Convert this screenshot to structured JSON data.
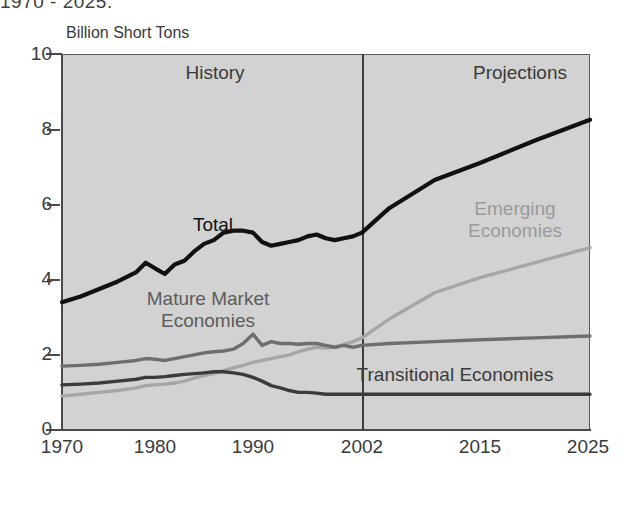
{
  "title_cut": "1970 - 2025.",
  "axis": {
    "y_unit_label": "Billion Short Tons",
    "y_ticks": [
      "0",
      "2",
      "4",
      "6",
      "8",
      "10"
    ],
    "y_tick_values": [
      0,
      2,
      4,
      6,
      8,
      10
    ],
    "x_ticks": [
      "1970",
      "1980",
      "1990",
      "2002",
      "2015",
      "2025"
    ],
    "x_tick_values": [
      1970,
      1980,
      1990,
      2002,
      2015,
      2025
    ],
    "ylim": [
      0,
      10
    ]
  },
  "sections": {
    "history_label": "History",
    "projections_label": "Projections",
    "divider_year": 2002
  },
  "series_labels": {
    "total": "Total",
    "mature": "Mature Market\nEconomies",
    "emerging": "Emerging\nEconomies",
    "transitional": "Transitional Economies"
  },
  "colors": {
    "plot_background": "#d2d2d2",
    "total": "#111111",
    "mature": "#6e6e6e",
    "emerging": "#a6a6a6",
    "transitional": "#3b3b3b",
    "axis": "#4a4a4a",
    "text": "#3a3a3a"
  },
  "chart_data": {
    "type": "line",
    "title": "1970 - 2025.",
    "xlabel": "",
    "ylabel": "Billion Short Tons",
    "ylim": [
      0,
      10
    ],
    "xlim": [
      1970,
      2025
    ],
    "grid": false,
    "legend": "inline-annotations",
    "annotations": [
      "History",
      "Projections"
    ],
    "x": [
      1970,
      1972,
      1974,
      1976,
      1978,
      1979,
      1980,
      1981,
      1982,
      1983,
      1984,
      1985,
      1986,
      1987,
      1988,
      1989,
      1990,
      1991,
      1992,
      1993,
      1994,
      1995,
      1996,
      1997,
      1998,
      1999,
      2000,
      2001,
      2002,
      2005,
      2010,
      2015,
      2020,
      2025
    ],
    "series": [
      {
        "name": "Total",
        "color": "#111111",
        "values": [
          3.4,
          3.55,
          3.75,
          3.95,
          4.2,
          4.45,
          4.3,
          4.15,
          4.4,
          4.5,
          4.75,
          4.95,
          5.05,
          5.25,
          5.3,
          5.3,
          5.25,
          5.0,
          4.9,
          4.95,
          5.0,
          5.05,
          5.15,
          5.2,
          5.1,
          5.05,
          5.1,
          5.15,
          5.25,
          5.9,
          6.65,
          7.1,
          7.7,
          8.25
        ]
      },
      {
        "name": "Emerging Economies",
        "color": "#a6a6a6",
        "values": [
          0.9,
          0.95,
          1.0,
          1.05,
          1.12,
          1.18,
          1.2,
          1.22,
          1.25,
          1.3,
          1.38,
          1.45,
          1.5,
          1.58,
          1.65,
          1.72,
          1.8,
          1.85,
          1.9,
          1.95,
          2.0,
          2.08,
          2.15,
          2.2,
          2.18,
          2.2,
          2.28,
          2.35,
          2.45,
          2.95,
          3.65,
          4.05,
          4.45,
          4.85
        ]
      },
      {
        "name": "Mature Market Economies",
        "color": "#6e6e6e",
        "values": [
          1.7,
          1.72,
          1.75,
          1.8,
          1.85,
          1.9,
          1.88,
          1.85,
          1.9,
          1.95,
          2.0,
          2.05,
          2.08,
          2.1,
          2.15,
          2.3,
          2.55,
          2.25,
          2.35,
          2.3,
          2.3,
          2.28,
          2.3,
          2.3,
          2.25,
          2.2,
          2.25,
          2.2,
          2.25,
          2.3,
          2.35,
          2.4,
          2.45,
          2.5
        ]
      },
      {
        "name": "Transitional Economies",
        "color": "#3b3b3b",
        "values": [
          1.2,
          1.22,
          1.25,
          1.3,
          1.35,
          1.4,
          1.4,
          1.42,
          1.45,
          1.48,
          1.5,
          1.52,
          1.55,
          1.55,
          1.52,
          1.48,
          1.4,
          1.3,
          1.18,
          1.12,
          1.05,
          1.0,
          1.0,
          0.98,
          0.95,
          0.95,
          0.95,
          0.95,
          0.95,
          0.95,
          0.95,
          0.95,
          0.95,
          0.95
        ]
      }
    ]
  }
}
